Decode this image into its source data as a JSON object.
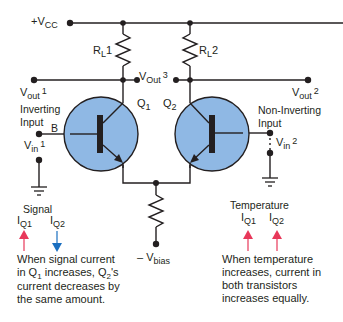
{
  "colors": {
    "wire": "#231f20",
    "transistor_fill": "#8fb8e4",
    "arrow_up": "#e8385a",
    "arrow_down": "#1a6fc0",
    "text": "#231f20"
  },
  "supply": {
    "prefix": "+V",
    "sub": "CC"
  },
  "bias": {
    "prefix": "– V",
    "sub": "bias"
  },
  "resistors": [
    {
      "id": "RL1",
      "main": "R",
      "sub": "L",
      "num": "1"
    },
    {
      "id": "RL2",
      "main": "R",
      "sub": "L",
      "num": "2"
    },
    {
      "id": "RE",
      "main": "",
      "sub": "",
      "num": ""
    }
  ],
  "transistors": [
    {
      "id": "Q1",
      "main": "Q",
      "num": "1"
    },
    {
      "id": "Q2",
      "main": "Q",
      "num": "2"
    }
  ],
  "outputs": {
    "vout1": {
      "main": "V",
      "sub": "out",
      "num": "1"
    },
    "vout2": {
      "main": "V",
      "sub": "out",
      "num": "2"
    },
    "vout3": {
      "main": "V",
      "sub": "Out",
      "num": "3"
    }
  },
  "inputs": {
    "inverting": {
      "line1": "Inverting",
      "line2": "Input",
      "base": "B",
      "main": "V",
      "sub": "in",
      "num": "1"
    },
    "non_inverting": {
      "line1": "Non-Inverting",
      "line2": "Input",
      "main": "V",
      "sub": "in",
      "num": "2"
    }
  },
  "left_panel": {
    "title": "Signal",
    "currents": [
      {
        "main": "I",
        "sub": "Q1",
        "direction": "up"
      },
      {
        "main": "I",
        "sub": "Q2",
        "direction": "down"
      }
    ],
    "note": {
      "l1": "When signal current",
      "l2a": "in Q",
      "l2s": "1",
      "l2b": " increases, Q",
      "l2s2": "2",
      "l2c": "'s",
      "l3": "current decreases by",
      "l4": "the same amount."
    }
  },
  "right_panel": {
    "title": "Temperature",
    "currents": [
      {
        "main": "I",
        "sub": "Q1",
        "direction": "up"
      },
      {
        "main": "I",
        "sub": "Q2",
        "direction": "up"
      }
    ],
    "note": {
      "l1": "When temperature",
      "l2": "increases, current in",
      "l3": "both transistors",
      "l4": "increases equally."
    }
  }
}
